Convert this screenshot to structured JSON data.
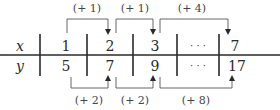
{
  "table": {
    "rows": [
      {
        "label": "x",
        "values": [
          "1",
          "2",
          "3",
          "· · ·",
          "7"
        ]
      },
      {
        "label": "y",
        "values": [
          "5",
          "7",
          "9",
          "· · ·",
          "17"
        ]
      }
    ]
  },
  "top_changes": [
    "(+ 1)",
    "(+ 1)",
    "(+ 4)"
  ],
  "bottom_changes": [
    "(+ 2)",
    "(+ 2)",
    "(+ 8)"
  ],
  "colors": {
    "line": "#2a2a2a",
    "text": "#2a2a2a"
  }
}
